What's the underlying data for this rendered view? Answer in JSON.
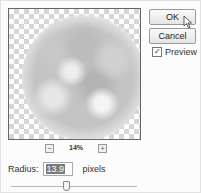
{
  "dialog": {
    "buttons": {
      "ok_label": "OK",
      "cancel_label": "Cancel"
    },
    "preview_checkbox": {
      "label": "Preview",
      "checked": true,
      "check_glyph": "✓"
    },
    "zoom": {
      "minus_glyph": "−",
      "plus_glyph": "+",
      "level": "14%"
    },
    "radius": {
      "label": "Radius:",
      "value": "13.9",
      "units": "pixels"
    },
    "slider": {
      "position_percent": 45
    }
  }
}
